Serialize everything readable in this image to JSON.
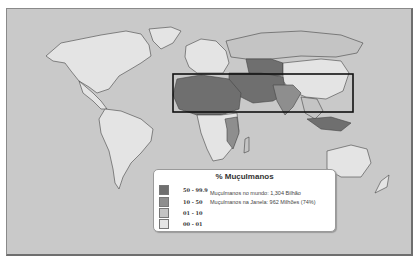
{
  "map": {
    "title": "% Muçulmanos",
    "background_color": "#c9c9c9",
    "highlight_box": {
      "label": "janela",
      "x": 172,
      "y": 73,
      "width": 180,
      "height": 38
    },
    "legend": {
      "title": "% Muçulmanos",
      "classes": [
        {
          "label": "50 - 99.9",
          "color": "#6f6f6f"
        },
        {
          "label": "10 - 50",
          "color": "#8e8e8e"
        },
        {
          "label": "01 - 10",
          "color": "#c4c4c4"
        },
        {
          "label": "00 - 01",
          "color": "#e4e4e4"
        }
      ],
      "stats": [
        "Muçulmanos no mundo: 1,304 Bilhão",
        "Muçulmanos na Janela: 962 Milhões (74%)"
      ]
    }
  }
}
